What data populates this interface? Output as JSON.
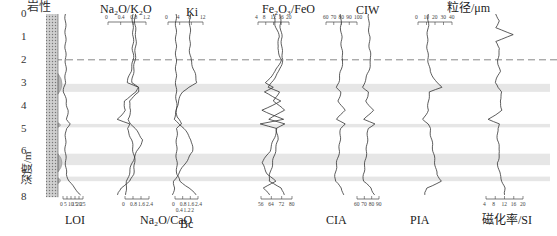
{
  "figure": {
    "lithology_label": "岩性",
    "y_axis_title": "深度/m",
    "y_ticks": [
      "0",
      "1",
      "2",
      "3",
      "4",
      "5",
      "6",
      "7",
      "8"
    ],
    "boundary_depth_m": 2,
    "highlight_bands_m": [
      [
        3.05,
        3.4
      ],
      [
        4.8,
        4.95
      ],
      [
        6.1,
        6.6
      ],
      [
        7.1,
        7.3
      ]
    ],
    "colors": {
      "line": "#333333",
      "band": "#e6e6e6",
      "dashed": "#888888",
      "litho_fill": "#b8b8b8"
    }
  },
  "chart_data": [
    {
      "type": "line",
      "title": "LOI",
      "axis_position": "bottom",
      "ticks": [
        "0",
        "5",
        "10",
        "15",
        "20",
        "25"
      ],
      "xlim": [
        0,
        25
      ],
      "depth": [
        0,
        0.5,
        1,
        1.5,
        2,
        2.5,
        3,
        3.2,
        3.4,
        3.8,
        4.2,
        4.6,
        4.8,
        5,
        5.5,
        6,
        6.5,
        7,
        7.3,
        7.6,
        7.9
      ],
      "values": [
        3,
        3,
        3.2,
        3,
        3.3,
        3.5,
        2.5,
        1,
        1,
        4,
        6,
        5,
        9,
        4,
        3,
        3,
        3.5,
        4,
        8,
        14,
        22
      ]
    },
    {
      "type": "line",
      "title": "Na2O/K2O",
      "axis_position": "top",
      "ticks": [
        "0",
        "0.4",
        "0.8",
        "1.2"
      ],
      "xlim": [
        0,
        1.2
      ],
      "depth": [
        0,
        0.5,
        1,
        1.5,
        2,
        2.5,
        3,
        3.2,
        3.4,
        3.8,
        4.2,
        4.6,
        4.8,
        5,
        5.5,
        6,
        6.5,
        7,
        7.3,
        7.6,
        7.9
      ],
      "values": [
        0.78,
        0.78,
        0.8,
        0.78,
        0.8,
        0.72,
        0.6,
        0.95,
        0.9,
        0.5,
        0.55,
        0.3,
        0.7,
        0.6,
        0.75,
        0.8,
        0.85,
        0.8,
        0.7,
        0.4,
        0.3
      ]
    },
    {
      "type": "line",
      "title": "Na2O/CaO",
      "axis_position": "bottom",
      "ticks": [
        "0",
        "0.8",
        "1.6",
        "2.4"
      ],
      "xlim": [
        0,
        2.4
      ],
      "depth": [
        0,
        0.5,
        1,
        1.5,
        2,
        2.5,
        3,
        3.2,
        3.4,
        3.8,
        4.2,
        4.6,
        4.8,
        5,
        5.5,
        6,
        6.5,
        7,
        7.3,
        7.6,
        7.9
      ],
      "values": [
        1,
        1,
        1.1,
        1.05,
        1.0,
        0.85,
        0.7,
        1.3,
        1.4,
        0.4,
        0.6,
        0.3,
        0.6,
        1.0,
        1.8,
        1.2,
        0.7,
        0.4,
        0.2,
        0.1,
        0.05
      ]
    },
    {
      "type": "line",
      "title": "Ki",
      "axis_position": "top",
      "ticks": [
        "0",
        "4",
        "8",
        "12"
      ],
      "xlim": [
        0,
        12
      ],
      "depth": [
        0,
        0.5,
        1,
        1.5,
        2,
        2.5,
        3,
        3.2,
        3.4,
        3.8,
        4.2,
        4.6,
        4.8,
        5,
        5.5,
        6,
        6.5,
        7,
        7.3,
        7.6,
        7.9
      ],
      "values": [
        7.5,
        7.5,
        7.6,
        7.4,
        7.8,
        9,
        10,
        7,
        5,
        3.5,
        3,
        2,
        4,
        5.5,
        8,
        8.5,
        6,
        3.5,
        2,
        2.2,
        1.5
      ]
    },
    {
      "type": "line",
      "title": "Bc",
      "axis_position": "bottom",
      "ticks": [
        "0",
        "0.8",
        "1.6",
        "2.4"
      ],
      "ticks_secondary": [
        "0.4",
        "1.2",
        "2"
      ],
      "xlim": [
        0,
        2.4
      ],
      "depth": [
        0,
        1,
        2,
        3,
        4,
        4.5,
        4.8,
        5,
        6,
        7,
        7.3,
        7.6,
        7.9
      ],
      "values": [
        0.1,
        0.1,
        0.1,
        0.1,
        0.15,
        0.2,
        0.7,
        0.2,
        0.15,
        0.2,
        0.5,
        1.5,
        2.2
      ]
    },
    {
      "type": "line",
      "title": "Fe2O3/FeO",
      "axis_position": "top",
      "ticks": [
        "4",
        "8",
        "12",
        "16",
        "20"
      ],
      "xlim": [
        4,
        20
      ],
      "depth": [
        0,
        0.5,
        1,
        1.5,
        2,
        2.5,
        3,
        3.2,
        3.4,
        3.8,
        4.2,
        4.6,
        4.8,
        5,
        5.5,
        6,
        6.5,
        7,
        7.3,
        7.6,
        7.9
      ],
      "values": [
        12,
        13,
        15,
        14,
        16,
        13,
        8,
        12,
        7,
        16,
        6,
        17,
        5,
        14,
        12,
        10,
        6,
        9,
        13,
        7,
        10
      ]
    },
    {
      "type": "line",
      "title": "CIA",
      "axis_position": "bottom",
      "ticks": [
        "56",
        "64",
        "72",
        "80"
      ],
      "xlim": [
        56,
        80
      ],
      "depth": [
        0,
        0.5,
        1,
        1.5,
        2,
        2.5,
        3,
        3.2,
        3.4,
        3.8,
        4.2,
        4.6,
        4.8,
        5,
        5.5,
        6,
        6.5,
        7,
        7.3,
        7.6,
        7.9
      ],
      "values": [
        71,
        71,
        72,
        72,
        73,
        70,
        64,
        62,
        70,
        66,
        74,
        62,
        74,
        68,
        69,
        67,
        65,
        63,
        62,
        72,
        74
      ]
    },
    {
      "type": "line",
      "title": "CIW",
      "axis_position": "top",
      "ticks": [
        "60",
        "70",
        "80",
        "90",
        "100"
      ],
      "xlim": [
        60,
        100
      ],
      "depth": [
        0,
        0.5,
        1,
        1.5,
        2,
        2.5,
        3,
        3.2,
        3.4,
        3.8,
        4.2,
        4.6,
        4.8,
        5,
        5.5,
        6,
        6.5,
        7,
        7.3,
        7.6,
        7.9
      ],
      "values": [
        79,
        79,
        80,
        80,
        82,
        79,
        76,
        74,
        79,
        76,
        84,
        74,
        84,
        79,
        78,
        77,
        74,
        72,
        72,
        80,
        83
      ]
    },
    {
      "type": "line",
      "title": "PIA",
      "axis_position": "bottom",
      "ticks": [
        "60",
        "70",
        "80",
        "90"
      ],
      "xlim": [
        60,
        90
      ],
      "depth": [
        0,
        0.5,
        1,
        1.5,
        2,
        2.5,
        3,
        3.2,
        3.4,
        3.8,
        4.2,
        4.6,
        4.8,
        5,
        5.5,
        6,
        6.5,
        7,
        7.3,
        7.6,
        7.9
      ],
      "values": [
        76,
        76,
        77,
        77,
        79,
        76,
        70,
        68,
        76,
        72,
        82,
        70,
        84,
        75,
        74,
        73,
        71,
        69,
        69,
        79,
        84
      ]
    },
    {
      "type": "line",
      "title": "粒径/μm",
      "axis_position": "top",
      "ticks": [
        "0",
        "10",
        "20",
        "30",
        "40"
      ],
      "xlim": [
        0,
        40
      ],
      "depth": [
        0,
        0.5,
        1,
        1.5,
        2,
        2.5,
        3,
        3.2,
        3.4,
        3.8,
        4.2,
        4.6,
        4.8,
        5,
        5.5,
        6,
        6.5,
        7,
        7.3,
        7.6,
        7.9
      ],
      "values": [
        12,
        12,
        11,
        11,
        12,
        14,
        22,
        28,
        14,
        12,
        12,
        6,
        12,
        14,
        16,
        18,
        20,
        22,
        28,
        10,
        8
      ]
    },
    {
      "type": "line",
      "title": "磁化率/SI",
      "axis_position": "bottom",
      "ticks": [
        "4",
        "8",
        "12",
        "16",
        "20"
      ],
      "xlim": [
        4,
        20
      ],
      "depth": [
        0,
        0.3,
        0.6,
        0.9,
        1.2,
        1.5,
        2,
        2.5,
        3,
        3.2,
        3.4,
        3.8,
        4.2,
        4.6,
        4.8,
        5,
        5.5,
        6,
        6.5,
        7,
        7.3,
        7.6,
        7.9
      ],
      "values": [
        8,
        10,
        8,
        16,
        8,
        10,
        9,
        10,
        8,
        9,
        11,
        10,
        11,
        5,
        10,
        9,
        9,
        10,
        9,
        10,
        11,
        12,
        12
      ]
    }
  ]
}
